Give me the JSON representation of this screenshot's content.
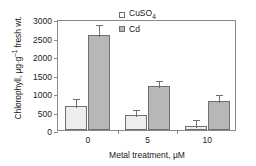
{
  "chart_data": {
    "type": "bar",
    "title": "",
    "xlabel": "Metal treatment, µM",
    "ylabel": "Chlorophyll, µg·g⁻¹ fresh wt.",
    "categories": [
      "0",
      "5",
      "10"
    ],
    "ylim": [
      0,
      3000
    ],
    "yticks": [
      0,
      500,
      1000,
      1500,
      2000,
      2500,
      3000
    ],
    "ytick_labels": [
      "0",
      "500",
      "1000",
      "1500",
      "2000",
      "2500",
      "3000"
    ],
    "grid": false,
    "legend_position": "top-right",
    "series": [
      {
        "name": "CuSO4",
        "legend_label": "CuSO₄",
        "color": "#ededed",
        "values": [
          650,
          400,
          100
        ],
        "errors": [
          230,
          200,
          230
        ]
      },
      {
        "name": "Cd",
        "legend_label": "Cd",
        "color": "#b7b7b7",
        "values": [
          2580,
          1180,
          780
        ],
        "errors": [
          320,
          190,
          210
        ]
      }
    ]
  },
  "legend": {
    "items": [
      {
        "label_main": "CuSO",
        "label_sub": "4"
      },
      {
        "label_main": "Cd",
        "label_sub": ""
      }
    ]
  },
  "axes": {
    "y_title_parts": {
      "lead": "Chlorophyll, µg·g",
      "sup": "–1",
      "tail": " fresh wt."
    },
    "x_title": "Metal treatment, µM"
  }
}
